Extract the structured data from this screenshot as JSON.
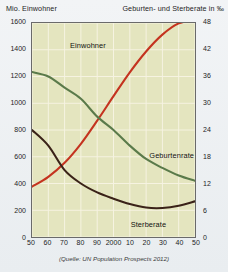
{
  "header": {
    "left_axis_title": "Mio. Einwohner",
    "right_axis_title": "Geburten- und Sterberate in ‰"
  },
  "source_note": "(Quelle: UN Population Prospects 2012)",
  "series_labels": {
    "einwohner": "Einwohner",
    "geburtenrate": "Geburtenrate",
    "sterberate": "Sterberate"
  },
  "colors": {
    "plot_background": "#e4e5bf",
    "grid": "#f6f3e2",
    "frame": "#6a6a6a",
    "einwohner": "#c4331f",
    "geburtenrate": "#5a7a4a",
    "sterberate": "#3a2218",
    "page_background": "#eef1f3"
  },
  "chart_data": {
    "type": "line",
    "title": "",
    "xlabel": "",
    "ylabel": "Mio. Einwohner",
    "y2label": "Geburten- und Sterberate in ‰",
    "grid": true,
    "legend": "inline-labels",
    "x": [
      1950,
      1960,
      1970,
      1980,
      1990,
      2000,
      2010,
      2020,
      2030,
      2040,
      2050
    ],
    "xtick_labels": [
      "50",
      "60",
      "70",
      "80",
      "90",
      "2000",
      "10",
      "20",
      "30",
      "40",
      "50"
    ],
    "xlim": [
      1950,
      2050
    ],
    "ylim": [
      0,
      1600
    ],
    "ytick_labels": [
      "0",
      "200",
      "400",
      "600",
      "800",
      "1000",
      "1200",
      "1400",
      "1600"
    ],
    "ytick_values": [
      0,
      200,
      400,
      600,
      800,
      1000,
      1200,
      1400,
      1600
    ],
    "y2lim": [
      0,
      48
    ],
    "y2tick_labels": [
      "0",
      "6",
      "12",
      "18",
      "24",
      "30",
      "36",
      "42",
      "48"
    ],
    "y2tick_values": [
      0,
      6,
      12,
      18,
      24,
      30,
      36,
      42,
      48
    ],
    "series": [
      {
        "name": "Einwohner",
        "axis": "left",
        "unit": "Mio.",
        "color": "#c4331f",
        "values": [
          376,
          450,
          555,
          697,
          870,
          1053,
          1231,
          1387,
          1513,
          1597,
          1620
        ]
      },
      {
        "name": "Geburtenrate",
        "axis": "right",
        "unit": "‰",
        "color": "#5a7a4a",
        "values": [
          37.0,
          36.0,
          33.5,
          31.0,
          27.0,
          24.0,
          20.5,
          17.5,
          15.5,
          13.8,
          12.6
        ]
      },
      {
        "name": "Sterberate",
        "axis": "right",
        "unit": "‰",
        "color": "#3a2218",
        "values": [
          24.0,
          20.5,
          15.0,
          12.0,
          10.0,
          8.6,
          7.4,
          6.6,
          6.5,
          7.0,
          8.0
        ]
      }
    ]
  }
}
